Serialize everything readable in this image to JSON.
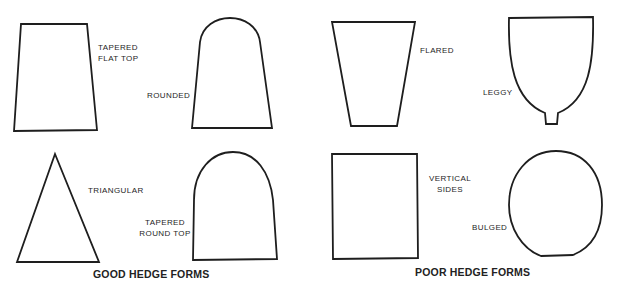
{
  "groups": [
    {
      "caption": "GOOD HEDGE FORMS",
      "shapes": [
        {
          "name": "tapered-flat-top",
          "label_lines": [
            "TAPERED",
            "FLAT TOP"
          ]
        },
        {
          "name": "rounded",
          "label_lines": [
            "ROUNDED"
          ]
        },
        {
          "name": "triangular",
          "label_lines": [
            "TRIANGULAR"
          ]
        },
        {
          "name": "tapered-round-top",
          "label_lines": [
            "TAPERED",
            "ROUND TOP"
          ]
        }
      ]
    },
    {
      "caption": "POOR HEDGE FORMS",
      "shapes": [
        {
          "name": "flared",
          "label_lines": [
            "FLARED"
          ]
        },
        {
          "name": "leggy",
          "label_lines": [
            "LEGGY"
          ]
        },
        {
          "name": "vertical-sides",
          "label_lines": [
            "VERTICAL",
            "SIDES"
          ]
        },
        {
          "name": "bulged",
          "label_lines": [
            "BULGED"
          ]
        }
      ]
    }
  ],
  "colors": {
    "stroke": "#1e1e1e",
    "background": "#ffffff"
  }
}
